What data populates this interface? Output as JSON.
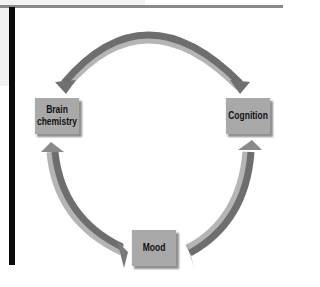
{
  "diagram": {
    "type": "cycle",
    "nodes": [
      {
        "id": "brain",
        "label": "Brain chemistry",
        "line1": "Brain",
        "line2": "chemistry"
      },
      {
        "id": "cognition",
        "label": "Cognition"
      },
      {
        "id": "mood",
        "label": "Mood"
      }
    ],
    "edges": [
      {
        "from": "brain",
        "to": "cognition",
        "bidirectional": true
      },
      {
        "from": "cognition",
        "to": "mood"
      },
      {
        "from": "mood",
        "to": "brain"
      }
    ],
    "colors": {
      "box_fill": "#a9a9a9",
      "arrow_dark": "#6e6e6e",
      "arrow_light": "#b5b5b5",
      "left_bar": "#0a0a0a",
      "top_rule": "#8a8a8a"
    }
  }
}
